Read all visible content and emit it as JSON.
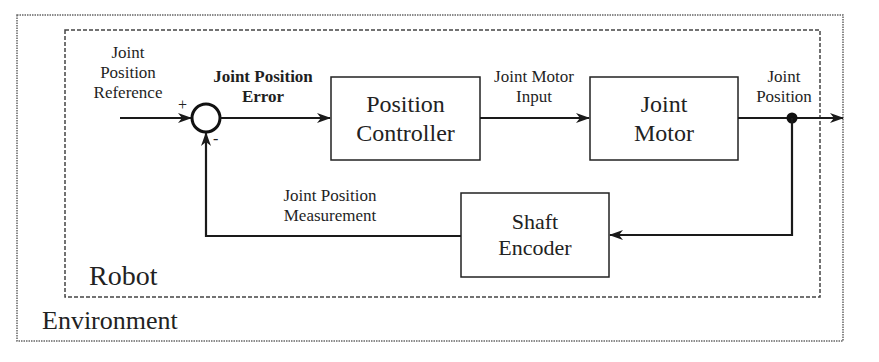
{
  "diagram": {
    "type": "control-loop-block-diagram",
    "containers": {
      "environment": {
        "label": "Environment"
      },
      "robot": {
        "label": "Robot"
      }
    },
    "blocks": {
      "position_controller": {
        "line1": "Position",
        "line2": "Controller"
      },
      "joint_motor": {
        "line1": "Joint",
        "line2": "Motor"
      },
      "shaft_encoder": {
        "line1": "Shaft",
        "line2": "Encoder"
      }
    },
    "summing_junction": {
      "plus": "+",
      "minus": "-"
    },
    "signals": {
      "reference": {
        "line1": "Joint",
        "line2": "Position",
        "line3": "Reference"
      },
      "error": {
        "line1": "Joint Position",
        "line2": "Error"
      },
      "motor_input": {
        "line1": "Joint Motor",
        "line2": "Input"
      },
      "output": {
        "line1": "Joint",
        "line2": "Position"
      },
      "measurement": {
        "line1": "Joint Position",
        "line2": "Measurement"
      }
    },
    "edges": [
      {
        "from": "reference",
        "to": "summing_junction",
        "sign": "+"
      },
      {
        "from": "summing_junction",
        "to": "position_controller",
        "label": "Joint Position Error"
      },
      {
        "from": "position_controller",
        "to": "joint_motor",
        "label": "Joint Motor Input"
      },
      {
        "from": "joint_motor",
        "to": "output",
        "label": "Joint Position"
      },
      {
        "from": "output",
        "to": "shaft_encoder"
      },
      {
        "from": "shaft_encoder",
        "to": "summing_junction",
        "sign": "-",
        "label": "Joint Position Measurement"
      }
    ],
    "colors": {
      "stroke": "#1a1a1a",
      "background": "#ffffff",
      "container_stroke": "#555555"
    }
  }
}
